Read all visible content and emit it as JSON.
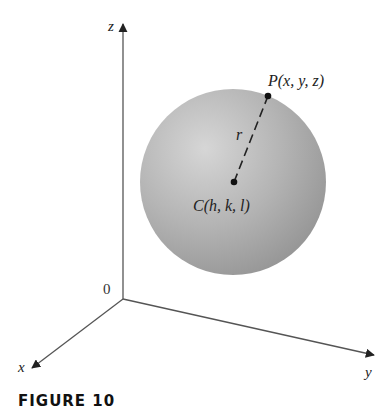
{
  "figure": {
    "caption": "FIGURE 10",
    "axes": {
      "z_label": "z",
      "x_label": "x",
      "y_label": "y",
      "origin_label": "0"
    },
    "sphere": {
      "center_label": "C(h, k, l)",
      "point_label": "P(x, y, z)",
      "radius_label": "r",
      "fill_color": "#a9a9a9",
      "highlight_color": "#d8d8d8"
    },
    "axis_color": "#555555"
  }
}
